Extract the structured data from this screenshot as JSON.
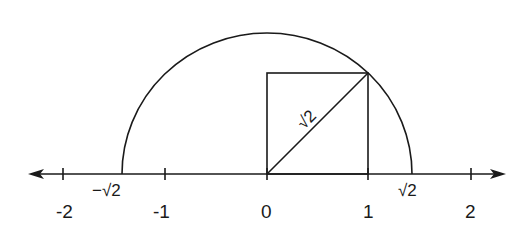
{
  "diagram": {
    "axis": {
      "ticks": [
        {
          "value": -2,
          "label": "-2"
        },
        {
          "value": -1,
          "label": "-1"
        },
        {
          "value": 0,
          "label": "0"
        },
        {
          "value": 1,
          "label": "1"
        },
        {
          "value": 2,
          "label": "2"
        }
      ],
      "special_points": [
        {
          "value": -1.4142,
          "label": "−√2"
        },
        {
          "value": 1.4142,
          "label": "√2"
        }
      ]
    },
    "square": {
      "side": 1,
      "diagonal_label": "√2"
    },
    "arc": {
      "center": 0,
      "radius_label": "√2"
    }
  },
  "labels": {
    "neg2": "-2",
    "neg1": "-1",
    "zero": "0",
    "one": "1",
    "two": "2",
    "neg_sqrt2": "−√2",
    "pos_sqrt2": "√2",
    "diag_sqrt2": "√2"
  },
  "colors": {
    "ink": "#1a1a1a",
    "paper": "#ffffff"
  }
}
